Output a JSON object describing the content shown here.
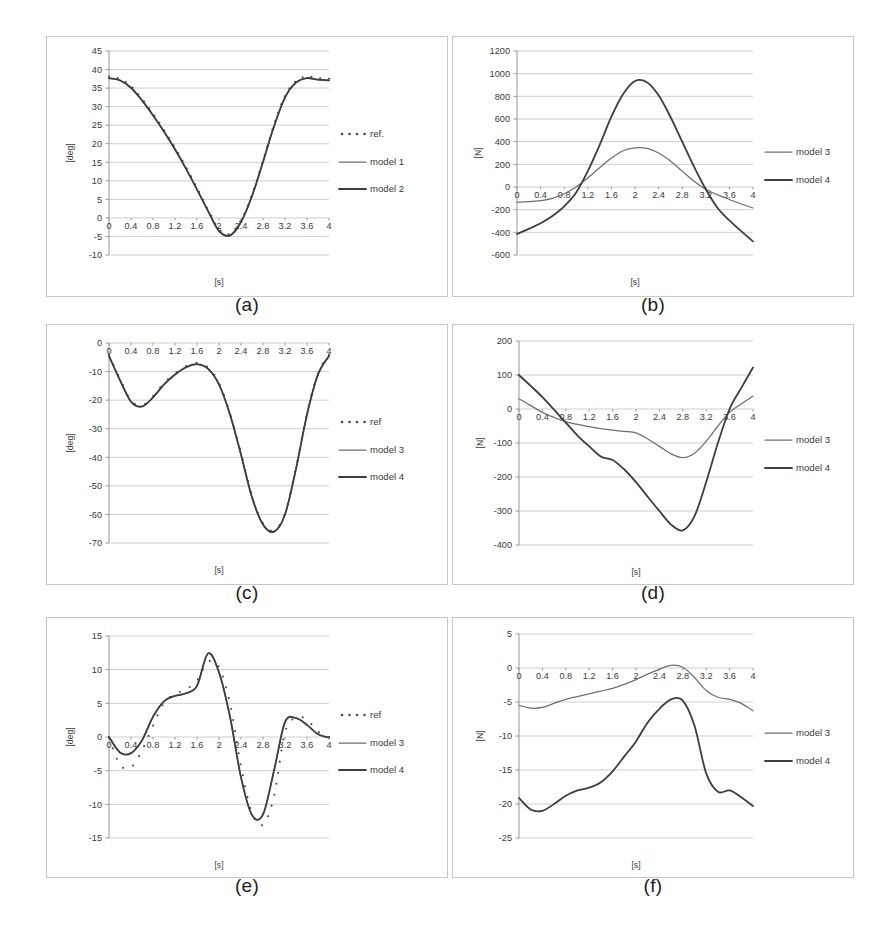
{
  "figure": {
    "panels": [
      {
        "id": "a",
        "caption": "(a)",
        "ylabel": "[deg]",
        "xlabel": "[s]",
        "yticks": [
          "-10",
          "-5",
          "0",
          "5",
          "10",
          "15",
          "20",
          "25",
          "30",
          "35",
          "40",
          "45"
        ],
        "xticks": [
          "0",
          "0.4",
          "0.8",
          "1.2",
          "1.6",
          "2",
          "2.4",
          "2.8",
          "3.2",
          "3.6",
          "4"
        ],
        "legend": [
          "ref.",
          "model 1",
          "model 2"
        ],
        "legend_styles": [
          "dots",
          "line-thin",
          "line-thick"
        ]
      },
      {
        "id": "b",
        "caption": "(b)",
        "ylabel": "[N]",
        "xlabel": "[s]",
        "yticks": [
          "-600",
          "-400",
          "-200",
          "0",
          "200",
          "400",
          "600",
          "800",
          "1000",
          "1200"
        ],
        "xticks": [
          "0",
          "0.4",
          "0.8",
          "1.2",
          "1.6",
          "2",
          "2.4",
          "2.8",
          "3.2",
          "3.6",
          "4"
        ],
        "legend": [
          "model 3",
          "model 4"
        ],
        "legend_styles": [
          "line-thin",
          "line-thick"
        ]
      },
      {
        "id": "c",
        "caption": "(c)",
        "ylabel": "[deg]",
        "xlabel": "[s]",
        "yticks": [
          "-70",
          "-60",
          "-50",
          "-40",
          "-30",
          "-20",
          "-10",
          "0"
        ],
        "xticks": [
          "0",
          "0.4",
          "0.8",
          "1.2",
          "1.6",
          "2",
          "2.4",
          "2.8",
          "3.2",
          "3.6",
          "4"
        ],
        "legend": [
          "ref",
          "model 3",
          "model 4"
        ],
        "legend_styles": [
          "dots",
          "line-thin",
          "line-thick"
        ]
      },
      {
        "id": "d",
        "caption": "(d)",
        "ylabel": "[N]",
        "xlabel": "[s]",
        "yticks": [
          "-400",
          "-300",
          "-200",
          "-100",
          "0",
          "100",
          "200"
        ],
        "xticks": [
          "0",
          "0.4",
          "0.8",
          "1.2",
          "1.6",
          "2",
          "2.4",
          "2.8",
          "3.2",
          "3.6",
          "4"
        ],
        "legend": [
          "model 3",
          "model 4"
        ],
        "legend_styles": [
          "line-thin",
          "line-thick"
        ]
      },
      {
        "id": "e",
        "caption": "(e)",
        "ylabel": "[deg]",
        "xlabel": "[s]",
        "yticks": [
          "-15",
          "-10",
          "-5",
          "0",
          "5",
          "10",
          "15"
        ],
        "xticks": [
          "0",
          "0.4",
          "0.8",
          "1.2",
          "1.6",
          "2",
          "2.4",
          "2.8",
          "3.2",
          "3.6",
          "4"
        ],
        "legend": [
          "ref",
          "model 3",
          "model 4"
        ],
        "legend_styles": [
          "dots",
          "line-thin",
          "line-thick"
        ]
      },
      {
        "id": "f",
        "caption": "(f)",
        "ylabel": "[N]",
        "xlabel": "[s]",
        "yticks": [
          "-25",
          "-20",
          "-15",
          "-10",
          "-5",
          "0",
          "5"
        ],
        "xticks": [
          "0",
          "0.4",
          "0.8",
          "1.2",
          "1.6",
          "2",
          "2.4",
          "2.8",
          "3.2",
          "3.6",
          "4"
        ],
        "legend": [
          "model 3",
          "model 4"
        ],
        "legend_styles": [
          "line-thin",
          "line-thick"
        ]
      }
    ]
  },
  "chart_data": [
    {
      "panel": "a",
      "type": "line",
      "title": "",
      "xlabel": "[s]",
      "ylabel": "[deg]",
      "xlim": [
        0,
        4
      ],
      "ylim": [
        -10,
        45
      ],
      "grid": true,
      "legend_position": "right",
      "x": [
        0,
        0.2,
        0.4,
        0.6,
        0.8,
        1.0,
        1.2,
        1.4,
        1.6,
        1.8,
        2.0,
        2.2,
        2.4,
        2.6,
        2.8,
        3.0,
        3.2,
        3.4,
        3.6,
        3.8,
        4.0
      ],
      "series": [
        {
          "name": "ref.",
          "style": "dots",
          "values": [
            37.8,
            37.2,
            35.2,
            31.8,
            27.8,
            23.4,
            18.6,
            13.4,
            7.8,
            2.0,
            -3.4,
            -4.6,
            -1.0,
            6.0,
            15.2,
            24.8,
            32.6,
            36.6,
            37.8,
            37.4,
            37.2
          ]
        },
        {
          "name": "model 1",
          "style": "line-thin",
          "values": [
            37.6,
            37.0,
            35.0,
            31.6,
            27.6,
            23.2,
            18.4,
            13.2,
            7.6,
            1.8,
            -3.6,
            -4.8,
            -1.2,
            5.8,
            15.0,
            24.6,
            32.4,
            36.4,
            37.6,
            37.2,
            37.0
          ]
        },
        {
          "name": "model 2",
          "style": "line-thick",
          "values": [
            37.7,
            37.1,
            35.1,
            31.7,
            27.7,
            23.3,
            18.5,
            13.3,
            7.7,
            1.9,
            -3.5,
            -4.7,
            -1.1,
            5.9,
            15.1,
            24.7,
            32.5,
            36.5,
            37.7,
            37.3,
            37.1
          ]
        }
      ]
    },
    {
      "panel": "b",
      "type": "line",
      "title": "",
      "xlabel": "[s]",
      "ylabel": "[N]",
      "xlim": [
        0,
        4
      ],
      "ylim": [
        -600,
        1200
      ],
      "grid": true,
      "legend_position": "right",
      "x": [
        0,
        0.2,
        0.4,
        0.6,
        0.8,
        1.0,
        1.2,
        1.4,
        1.6,
        1.8,
        2.0,
        2.2,
        2.4,
        2.6,
        2.8,
        3.0,
        3.2,
        3.4,
        3.6,
        3.8,
        4.0
      ],
      "series": [
        {
          "name": "model 3",
          "style": "line-thin",
          "values": [
            -135,
            -130,
            -120,
            -100,
            -60,
            0,
            80,
            170,
            255,
            320,
            345,
            340,
            300,
            230,
            140,
            50,
            -20,
            -70,
            -110,
            -150,
            -185
          ]
        },
        {
          "name": "model 4",
          "style": "line-thick",
          "values": [
            -415,
            -370,
            -320,
            -255,
            -170,
            -50,
            140,
            370,
            620,
            820,
            935,
            925,
            810,
            620,
            400,
            180,
            -20,
            -185,
            -295,
            -390,
            -480
          ]
        }
      ]
    },
    {
      "panel": "c",
      "type": "line",
      "title": "",
      "xlabel": "[s]",
      "ylabel": "[deg]",
      "xlim": [
        0,
        4
      ],
      "ylim": [
        -70,
        0
      ],
      "grid": true,
      "legend_position": "right",
      "x": [
        0,
        0.2,
        0.4,
        0.6,
        0.8,
        1.0,
        1.2,
        1.4,
        1.6,
        1.8,
        2.0,
        2.2,
        2.4,
        2.6,
        2.8,
        3.0,
        3.2,
        3.4,
        3.6,
        3.8,
        4.0
      ],
      "series": [
        {
          "name": "ref",
          "style": "dots",
          "values": [
            -4.5,
            -13.0,
            -20.5,
            -22.2,
            -19.0,
            -14.5,
            -11.0,
            -8.5,
            -7.4,
            -9.0,
            -14.5,
            -25.0,
            -39.0,
            -54.0,
            -63.5,
            -66.0,
            -60.0,
            -44.0,
            -25.0,
            -11.0,
            -4.5
          ]
        },
        {
          "name": "model 3",
          "style": "line-thin",
          "values": [
            -4.6,
            -13.1,
            -20.6,
            -22.3,
            -19.1,
            -14.6,
            -11.1,
            -8.6,
            -7.5,
            -9.1,
            -14.6,
            -25.1,
            -39.1,
            -54.1,
            -63.6,
            -66.1,
            -60.1,
            -44.1,
            -25.1,
            -11.1,
            -4.6
          ]
        },
        {
          "name": "model 4",
          "style": "line-thick",
          "values": [
            -4.5,
            -13.0,
            -20.5,
            -22.2,
            -19.0,
            -14.5,
            -11.0,
            -8.5,
            -7.4,
            -9.0,
            -14.5,
            -25.0,
            -39.0,
            -54.0,
            -63.5,
            -66.0,
            -60.0,
            -44.0,
            -25.0,
            -11.0,
            -4.5
          ]
        }
      ]
    },
    {
      "panel": "d",
      "type": "line",
      "title": "",
      "xlabel": "[s]",
      "ylabel": "[N]",
      "xlim": [
        0,
        4
      ],
      "ylim": [
        -400,
        200
      ],
      "grid": true,
      "legend_position": "right",
      "x": [
        0,
        0.2,
        0.4,
        0.6,
        0.8,
        1.0,
        1.2,
        1.4,
        1.6,
        1.8,
        2.0,
        2.2,
        2.4,
        2.6,
        2.8,
        3.0,
        3.2,
        3.4,
        3.6,
        3.8,
        4.0
      ],
      "series": [
        {
          "name": "model 3",
          "style": "line-thin",
          "values": [
            30,
            10,
            -10,
            -25,
            -38,
            -45,
            -52,
            -58,
            -62,
            -66,
            -70,
            -88,
            -110,
            -132,
            -143,
            -130,
            -95,
            -50,
            -10,
            15,
            38
          ]
        },
        {
          "name": "model 4",
          "style": "line-thick",
          "values": [
            100,
            68,
            35,
            -2,
            -40,
            -78,
            -110,
            -140,
            -150,
            -178,
            -215,
            -258,
            -300,
            -340,
            -357,
            -315,
            -215,
            -100,
            0,
            62,
            122
          ]
        }
      ]
    },
    {
      "panel": "e",
      "type": "line",
      "title": "",
      "xlabel": "[s]",
      "ylabel": "[deg]",
      "xlim": [
        0,
        4
      ],
      "ylim": [
        -15,
        15
      ],
      "grid": true,
      "legend_position": "right",
      "x": [
        0,
        0.2,
        0.4,
        0.6,
        0.8,
        1.0,
        1.2,
        1.4,
        1.6,
        1.8,
        2.0,
        2.2,
        2.4,
        2.6,
        2.8,
        3.0,
        3.2,
        3.4,
        3.6,
        3.8,
        4.0
      ],
      "series": [
        {
          "name": "ref",
          "style": "dots",
          "values": [
            -0.3,
            -4.3,
            -4.7,
            -2.2,
            1.5,
            4.9,
            6.2,
            6.9,
            8.2,
            11.0,
            10.2,
            4.8,
            -4.5,
            -11.5,
            -13.2,
            -9.0,
            0.5,
            2.7,
            2.4,
            0.6,
            -0.2
          ]
        },
        {
          "name": "model 3",
          "style": "line-thin",
          "values": [
            0.0,
            -2.3,
            -2.4,
            -0.5,
            3.0,
            5.3,
            6.1,
            6.5,
            7.6,
            12.4,
            9.6,
            3.0,
            -6.0,
            -11.6,
            -11.5,
            -5.0,
            2.2,
            2.8,
            1.8,
            0.4,
            -0.1
          ]
        },
        {
          "name": "model 4",
          "style": "line-thick",
          "values": [
            0.0,
            -2.3,
            -2.4,
            -0.5,
            3.0,
            5.3,
            6.1,
            6.5,
            7.6,
            12.4,
            9.6,
            3.0,
            -6.0,
            -11.6,
            -11.5,
            -5.0,
            2.2,
            2.8,
            1.8,
            0.4,
            -0.1
          ]
        }
      ]
    },
    {
      "panel": "f",
      "type": "line",
      "title": "",
      "xlabel": "[s]",
      "ylabel": "[N]",
      "xlim": [
        0,
        4
      ],
      "ylim": [
        -25,
        5
      ],
      "grid": true,
      "legend_position": "right",
      "x": [
        0,
        0.2,
        0.4,
        0.6,
        0.8,
        1.0,
        1.2,
        1.4,
        1.6,
        1.8,
        2.0,
        2.2,
        2.4,
        2.6,
        2.8,
        3.0,
        3.2,
        3.4,
        3.6,
        3.8,
        4.0
      ],
      "series": [
        {
          "name": "model 3",
          "style": "line-thin",
          "values": [
            -5.5,
            -5.9,
            -5.8,
            -5.2,
            -4.6,
            -4.2,
            -3.8,
            -3.4,
            -3.0,
            -2.4,
            -1.7,
            -0.9,
            -0.2,
            0.4,
            0.1,
            -1.4,
            -3.3,
            -4.3,
            -4.6,
            -5.2,
            -6.3
          ]
        },
        {
          "name": "model 4",
          "style": "line-thick",
          "values": [
            -19.1,
            -20.8,
            -21.0,
            -20.0,
            -18.8,
            -18.0,
            -17.6,
            -16.8,
            -15.2,
            -13.0,
            -10.8,
            -8.0,
            -6.0,
            -4.6,
            -4.8,
            -8.5,
            -15.5,
            -18.2,
            -18.0,
            -19.0,
            -20.3
          ]
        }
      ]
    }
  ],
  "colors": {
    "thin_series": "#6f6f6f",
    "thick_series": "#3d3d3d",
    "grid": "#b9b9b9",
    "axis": "#8c8c8c",
    "panel_border": "#c8c8c8",
    "text": "#3a3a3a"
  }
}
